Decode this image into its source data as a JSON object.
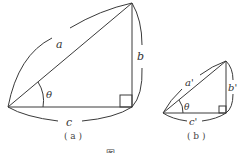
{
  "figure": {
    "caption": "图",
    "panels": [
      {
        "id": "a",
        "caption": "( a )",
        "labels": {
          "hypotenuse": "a",
          "vertical": "b",
          "horizontal": "c",
          "angle": "θ"
        },
        "right_angle_marker": true
      },
      {
        "id": "b",
        "caption": "( b )",
        "labels": {
          "hypotenuse": "a'",
          "vertical": "b'",
          "horizontal": "c'",
          "angle": "θ"
        },
        "right_angle_marker": true
      }
    ]
  },
  "colors": {
    "stroke": "#3a3a3a",
    "text": "#333333"
  }
}
